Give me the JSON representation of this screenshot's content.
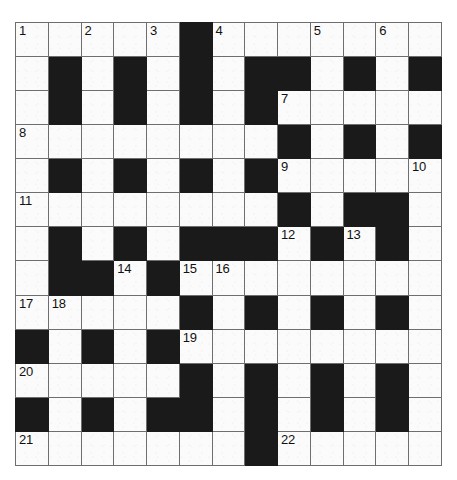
{
  "puzzle": {
    "type": "crossword-grid",
    "rows": 13,
    "columns": 13,
    "colors": {
      "block": "#1a1a1a",
      "cell": "#fbfbfb",
      "grid_line": "#6e6e6e",
      "border": "#4a4a4a",
      "number_text": "#111111"
    },
    "grid": [
      [
        {
          "type": "white",
          "number": "1"
        },
        {
          "type": "white",
          "number": ""
        },
        {
          "type": "white",
          "number": "2"
        },
        {
          "type": "white",
          "number": ""
        },
        {
          "type": "white",
          "number": "3"
        },
        {
          "type": "block",
          "number": ""
        },
        {
          "type": "white",
          "number": "4"
        },
        {
          "type": "white",
          "number": ""
        },
        {
          "type": "white",
          "number": ""
        },
        {
          "type": "white",
          "number": "5"
        },
        {
          "type": "white",
          "number": ""
        },
        {
          "type": "white",
          "number": "6"
        },
        {
          "type": "white",
          "number": ""
        }
      ],
      [
        {
          "type": "white",
          "number": ""
        },
        {
          "type": "block",
          "number": ""
        },
        {
          "type": "white",
          "number": ""
        },
        {
          "type": "block",
          "number": ""
        },
        {
          "type": "white",
          "number": ""
        },
        {
          "type": "block",
          "number": ""
        },
        {
          "type": "white",
          "number": ""
        },
        {
          "type": "block",
          "number": ""
        },
        {
          "type": "block",
          "number": ""
        },
        {
          "type": "white",
          "number": ""
        },
        {
          "type": "block",
          "number": ""
        },
        {
          "type": "white",
          "number": ""
        },
        {
          "type": "block",
          "number": ""
        }
      ],
      [
        {
          "type": "white",
          "number": ""
        },
        {
          "type": "block",
          "number": ""
        },
        {
          "type": "white",
          "number": ""
        },
        {
          "type": "block",
          "number": ""
        },
        {
          "type": "white",
          "number": ""
        },
        {
          "type": "block",
          "number": ""
        },
        {
          "type": "white",
          "number": ""
        },
        {
          "type": "block",
          "number": ""
        },
        {
          "type": "white",
          "number": "7"
        },
        {
          "type": "white",
          "number": ""
        },
        {
          "type": "white",
          "number": ""
        },
        {
          "type": "white",
          "number": ""
        },
        {
          "type": "white",
          "number": ""
        }
      ],
      [
        {
          "type": "white",
          "number": "8"
        },
        {
          "type": "white",
          "number": ""
        },
        {
          "type": "white",
          "number": ""
        },
        {
          "type": "white",
          "number": ""
        },
        {
          "type": "white",
          "number": ""
        },
        {
          "type": "white",
          "number": ""
        },
        {
          "type": "white",
          "number": ""
        },
        {
          "type": "white",
          "number": ""
        },
        {
          "type": "block",
          "number": ""
        },
        {
          "type": "white",
          "number": ""
        },
        {
          "type": "block",
          "number": ""
        },
        {
          "type": "white",
          "number": ""
        },
        {
          "type": "block",
          "number": ""
        }
      ],
      [
        {
          "type": "white",
          "number": ""
        },
        {
          "type": "block",
          "number": ""
        },
        {
          "type": "white",
          "number": ""
        },
        {
          "type": "block",
          "number": ""
        },
        {
          "type": "white",
          "number": ""
        },
        {
          "type": "block",
          "number": ""
        },
        {
          "type": "white",
          "number": ""
        },
        {
          "type": "block",
          "number": ""
        },
        {
          "type": "white",
          "number": "9"
        },
        {
          "type": "white",
          "number": ""
        },
        {
          "type": "white",
          "number": ""
        },
        {
          "type": "white",
          "number": ""
        },
        {
          "type": "white",
          "number": "10"
        }
      ],
      [
        {
          "type": "white",
          "number": "11"
        },
        {
          "type": "white",
          "number": ""
        },
        {
          "type": "white",
          "number": ""
        },
        {
          "type": "white",
          "number": ""
        },
        {
          "type": "white",
          "number": ""
        },
        {
          "type": "white",
          "number": ""
        },
        {
          "type": "white",
          "number": ""
        },
        {
          "type": "white",
          "number": ""
        },
        {
          "type": "block",
          "number": ""
        },
        {
          "type": "white",
          "number": ""
        },
        {
          "type": "block",
          "number": ""
        },
        {
          "type": "block",
          "number": ""
        },
        {
          "type": "white",
          "number": ""
        }
      ],
      [
        {
          "type": "white",
          "number": ""
        },
        {
          "type": "block",
          "number": ""
        },
        {
          "type": "white",
          "number": ""
        },
        {
          "type": "block",
          "number": ""
        },
        {
          "type": "white",
          "number": ""
        },
        {
          "type": "block",
          "number": ""
        },
        {
          "type": "block",
          "number": ""
        },
        {
          "type": "block",
          "number": ""
        },
        {
          "type": "white",
          "number": "12"
        },
        {
          "type": "block",
          "number": ""
        },
        {
          "type": "white",
          "number": "13"
        },
        {
          "type": "block",
          "number": ""
        },
        {
          "type": "white",
          "number": ""
        }
      ],
      [
        {
          "type": "white",
          "number": ""
        },
        {
          "type": "block",
          "number": ""
        },
        {
          "type": "block",
          "number": ""
        },
        {
          "type": "white",
          "number": "14"
        },
        {
          "type": "block",
          "number": ""
        },
        {
          "type": "white",
          "number": "15"
        },
        {
          "type": "white",
          "number": "16"
        },
        {
          "type": "white",
          "number": ""
        },
        {
          "type": "white",
          "number": ""
        },
        {
          "type": "white",
          "number": ""
        },
        {
          "type": "white",
          "number": ""
        },
        {
          "type": "white",
          "number": ""
        },
        {
          "type": "white",
          "number": ""
        }
      ],
      [
        {
          "type": "white",
          "number": "17"
        },
        {
          "type": "white",
          "number": "18"
        },
        {
          "type": "white",
          "number": ""
        },
        {
          "type": "white",
          "number": ""
        },
        {
          "type": "white",
          "number": ""
        },
        {
          "type": "block",
          "number": ""
        },
        {
          "type": "white",
          "number": ""
        },
        {
          "type": "block",
          "number": ""
        },
        {
          "type": "white",
          "number": ""
        },
        {
          "type": "block",
          "number": ""
        },
        {
          "type": "white",
          "number": ""
        },
        {
          "type": "block",
          "number": ""
        },
        {
          "type": "white",
          "number": ""
        }
      ],
      [
        {
          "type": "block",
          "number": ""
        },
        {
          "type": "white",
          "number": ""
        },
        {
          "type": "block",
          "number": ""
        },
        {
          "type": "white",
          "number": ""
        },
        {
          "type": "block",
          "number": ""
        },
        {
          "type": "white",
          "number": "19"
        },
        {
          "type": "white",
          "number": ""
        },
        {
          "type": "white",
          "number": ""
        },
        {
          "type": "white",
          "number": ""
        },
        {
          "type": "white",
          "number": ""
        },
        {
          "type": "white",
          "number": ""
        },
        {
          "type": "white",
          "number": ""
        },
        {
          "type": "white",
          "number": ""
        }
      ],
      [
        {
          "type": "white",
          "number": "20"
        },
        {
          "type": "white",
          "number": ""
        },
        {
          "type": "white",
          "number": ""
        },
        {
          "type": "white",
          "number": ""
        },
        {
          "type": "white",
          "number": ""
        },
        {
          "type": "block",
          "number": ""
        },
        {
          "type": "white",
          "number": ""
        },
        {
          "type": "block",
          "number": ""
        },
        {
          "type": "white",
          "number": ""
        },
        {
          "type": "block",
          "number": ""
        },
        {
          "type": "white",
          "number": ""
        },
        {
          "type": "block",
          "number": ""
        },
        {
          "type": "white",
          "number": ""
        }
      ],
      [
        {
          "type": "block",
          "number": ""
        },
        {
          "type": "white",
          "number": ""
        },
        {
          "type": "block",
          "number": ""
        },
        {
          "type": "white",
          "number": ""
        },
        {
          "type": "block",
          "number": ""
        },
        {
          "type": "block",
          "number": ""
        },
        {
          "type": "white",
          "number": ""
        },
        {
          "type": "block",
          "number": ""
        },
        {
          "type": "white",
          "number": ""
        },
        {
          "type": "block",
          "number": ""
        },
        {
          "type": "white",
          "number": ""
        },
        {
          "type": "block",
          "number": ""
        },
        {
          "type": "white",
          "number": ""
        }
      ],
      [
        {
          "type": "white",
          "number": "21"
        },
        {
          "type": "white",
          "number": ""
        },
        {
          "type": "white",
          "number": ""
        },
        {
          "type": "white",
          "number": ""
        },
        {
          "type": "white",
          "number": ""
        },
        {
          "type": "white",
          "number": ""
        },
        {
          "type": "white",
          "number": ""
        },
        {
          "type": "block",
          "number": ""
        },
        {
          "type": "white",
          "number": "22"
        },
        {
          "type": "white",
          "number": ""
        },
        {
          "type": "white",
          "number": ""
        },
        {
          "type": "white",
          "number": ""
        },
        {
          "type": "white",
          "number": ""
        }
      ]
    ]
  }
}
